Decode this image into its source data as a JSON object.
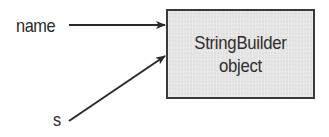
{
  "diagram": {
    "references": [
      {
        "label": "name"
      },
      {
        "label": "s"
      }
    ],
    "object": {
      "line1": "StringBuilder",
      "line2": "object"
    }
  },
  "colors": {
    "stroke": "#2a2a2a",
    "box_fill": "#e4e4e4",
    "box_border": "#3a3a3a",
    "background": "#ffffff"
  }
}
